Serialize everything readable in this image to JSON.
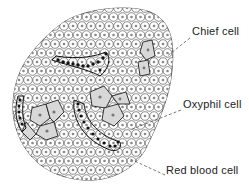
{
  "figure": {
    "labels": [
      {
        "id": "chief",
        "text": "Chief cell",
        "x": 192,
        "y": 31,
        "pointer": {
          "x1": 190,
          "y1": 38,
          "x2": 166,
          "y2": 57
        }
      },
      {
        "id": "oxyphil",
        "text": "Oxyphil cell",
        "x": 183,
        "y": 103,
        "pointer": {
          "x1": 181,
          "y1": 110,
          "x2": 130,
          "y2": 130
        }
      },
      {
        "id": "rbc",
        "text": "Red blood cell",
        "x": 167,
        "y": 169,
        "pointer": {
          "x1": 165,
          "y1": 175,
          "x2": 128,
          "y2": 158
        }
      }
    ]
  }
}
